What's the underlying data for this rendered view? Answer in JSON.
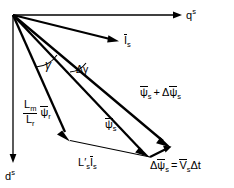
{
  "figure": {
    "type": "vector-phasor-diagram",
    "background_color": "#ffffff",
    "stroke_color": "#000000",
    "origin": {
      "x": 13,
      "y": 15
    }
  },
  "axes": [
    {
      "name": "q-axis",
      "label_base": "q",
      "label_sup": "s",
      "direction": "horizontal-right",
      "from": {
        "x": 13,
        "y": 15
      },
      "to": {
        "x": 180,
        "y": 15
      }
    },
    {
      "name": "d-axis",
      "label_base": "d",
      "label_sup": "s",
      "direction": "vertical-down",
      "from": {
        "x": 13,
        "y": 15
      },
      "to": {
        "x": 13,
        "y": 162
      }
    }
  ],
  "vectors": [
    {
      "name": "stator-current",
      "label_symbol": "I",
      "label_sub": "s",
      "overbar": true,
      "weight": "thick",
      "from": {
        "x": 13,
        "y": 15
      },
      "to": {
        "x": 118,
        "y": 41
      }
    },
    {
      "name": "stator-flux-plus-delta",
      "label_text": "psi_s + delta psi_s",
      "overbar": true,
      "weight": "thick",
      "from": {
        "x": 13,
        "y": 15
      },
      "to": {
        "x": 171,
        "y": 147
      }
    },
    {
      "name": "stator-flux",
      "label_symbol": "psi",
      "label_sub": "s",
      "overbar": true,
      "weight": "thick",
      "from": {
        "x": 13,
        "y": 15
      },
      "to": {
        "x": 150,
        "y": 157
      }
    },
    {
      "name": "rotor-flux-scaled",
      "label_text": "Lm/Lr psi_r",
      "overbar": true,
      "weight": "thick",
      "from": {
        "x": 13,
        "y": 15
      },
      "to": {
        "x": 70,
        "y": 140
      }
    },
    {
      "name": "leakage-drop",
      "label_text": "Ls' Is",
      "overbar": true,
      "weight": "thin",
      "from": {
        "x": 70,
        "y": 140
      },
      "to": {
        "x": 150,
        "y": 157
      }
    },
    {
      "name": "delta-stator-flux",
      "label_text": "delta psi_s = Vs delta t",
      "overbar": true,
      "weight": "thick",
      "from": {
        "x": 150,
        "y": 157
      },
      "to": {
        "x": 171,
        "y": 147
      }
    }
  ],
  "angles": [
    {
      "name": "gamma",
      "symbol": "γ",
      "between": [
        "d-axis-region",
        "rotor-flux-scaled"
      ],
      "label_position": {
        "x": 46,
        "y": 65
      }
    },
    {
      "name": "delta-gamma",
      "symbol": "Δγ",
      "between": [
        "stator-flux",
        "stator-flux-plus-delta"
      ],
      "label_position": {
        "x": 79,
        "y": 70
      }
    }
  ],
  "labels": {
    "q_axis": {
      "base": "q",
      "sup": "s"
    },
    "d_axis": {
      "base": "d",
      "sup": "s"
    },
    "current": {
      "symbol": "I",
      "sub": "s"
    },
    "flux": {
      "symbol": "ψ",
      "sub": "s"
    },
    "rotor_flux": {
      "symbol": "ψ",
      "sub": "r"
    },
    "inductance_num": {
      "symbol": "L",
      "sub": "m"
    },
    "inductance_den": {
      "symbol": "L",
      "sub": "r"
    },
    "leakage_inductance": {
      "symbol": "L",
      "prime": "′",
      "sub": "s"
    },
    "voltage": {
      "symbol": "V",
      "sub": "s"
    },
    "plus": "+",
    "equals": "=",
    "delta": "Δ",
    "delta_t": "Δt",
    "gamma": "γ",
    "delta_gamma": "Δγ"
  }
}
